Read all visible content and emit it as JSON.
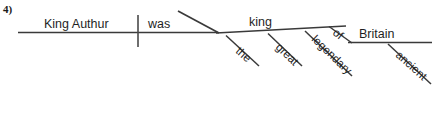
{
  "item": {
    "number_label": "4)"
  },
  "diagram": {
    "type": "reed-kellogg-sentence-diagram",
    "sentence": "King Authur was the great legendary king of ancient Britain",
    "subject": "King Authur",
    "verb": "was",
    "predicate_nominative": "king",
    "colors": {
      "line": "#3a3a3a",
      "text": "#1f1f1f",
      "background": "#ffffff"
    },
    "words": {
      "subject": "King Authur",
      "verb": "was",
      "complement": "king",
      "modifier_the": "the",
      "modifier_great": "great",
      "modifier_legendary": "legendary",
      "preposition_of": "of",
      "object_of_preposition": "Britain",
      "modifier_ancient": "ancient"
    }
  }
}
